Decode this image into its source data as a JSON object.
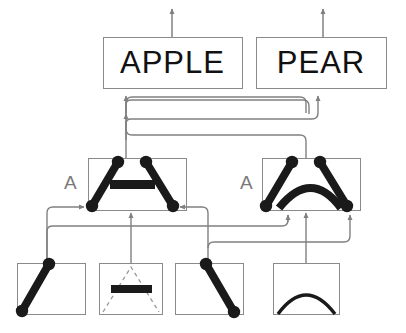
{
  "diagram": {
    "background_color": "#ffffff",
    "box_stroke_color": "#888888",
    "part_color": "#1a1a1a",
    "arrow_color": "#808080",
    "dashed_color": "#9a9a9a",
    "letter_color": "#7a7a7a",
    "text_color": "#111111"
  },
  "top_layer": {
    "name": "word-layer",
    "nodes": [
      {
        "id": "apple-node",
        "label": "APPLE",
        "x": 103,
        "y": 37,
        "width": 139,
        "height": 51,
        "font_size": 31
      },
      {
        "id": "pear-node",
        "label": "PEAR",
        "x": 256,
        "y": 37,
        "width": 130,
        "height": 51,
        "font_size": 31
      }
    ],
    "output_arrows": [
      {
        "id": "apple-output-arrow",
        "x": 172,
        "y_from": 37,
        "y_to": 8
      },
      {
        "id": "pear-output-arrow",
        "x": 323,
        "y_from": 37,
        "y_to": 8
      }
    ]
  },
  "middle_layer": {
    "name": "composite-part-layer",
    "nodes": [
      {
        "id": "composite-bar-node",
        "letter": "A",
        "letter_x": 64,
        "letter_y": 172,
        "x": 88,
        "y": 158,
        "width": 98,
        "height": 52,
        "shape": "triangle-with-bar"
      },
      {
        "id": "composite-arc-node",
        "letter": "A",
        "letter_x": 240,
        "letter_y": 172,
        "x": 262,
        "y": 158,
        "width": 98,
        "height": 52,
        "shape": "triangle-with-arc"
      }
    ]
  },
  "bottom_layer": {
    "name": "primitive-feature-layer",
    "nodes": [
      {
        "id": "primitive-diagonal-up",
        "x": 17,
        "y": 263,
        "width": 68,
        "height": 51,
        "shape": "diagonal-up-stroke"
      },
      {
        "id": "primitive-bar-in-triangle",
        "x": 99,
        "y": 263,
        "width": 63,
        "height": 51,
        "shape": "horizontal-bar-dashed-triangle"
      },
      {
        "id": "primitive-diagonal-down",
        "x": 175,
        "y": 263,
        "width": 68,
        "height": 51,
        "shape": "diagonal-down-stroke"
      },
      {
        "id": "primitive-arc",
        "x": 273,
        "y": 263,
        "width": 66,
        "height": 51,
        "shape": "arc-stroke"
      }
    ]
  },
  "connections": {
    "name": "feed-forward-connections",
    "description": "Arrows flow upward from primitive features to composite parts to words",
    "count": 14
  }
}
